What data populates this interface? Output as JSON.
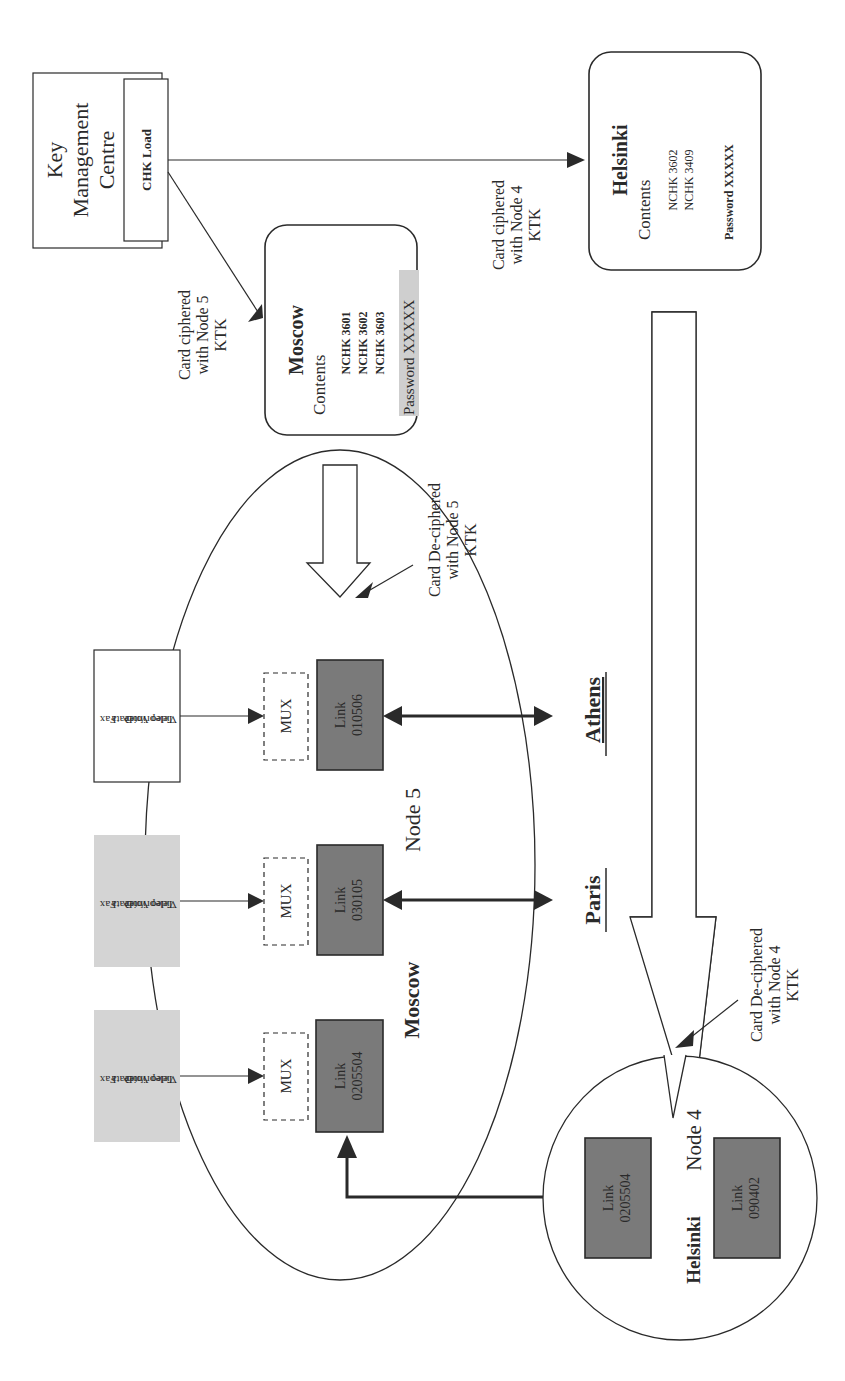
{
  "kmc": {
    "title_lines": [
      "Key",
      "Management",
      "Centre"
    ],
    "load_label": "CHK Load"
  },
  "moscow_card": {
    "title": "Moscow",
    "contents_label": "Contents",
    "keys": [
      "NCHK 3601",
      "NCHK 3602",
      "NCHK 3603"
    ],
    "password": "Password XXXXX"
  },
  "helsinki_card": {
    "title": "Helsinki",
    "contents_label": "Contents",
    "keys": [
      "NCHK 3602",
      "NCHK 3409"
    ],
    "password": "Password XXXXX"
  },
  "annotations": {
    "node5_cipher": [
      "Card ciphered",
      "with Node 5",
      "KTK"
    ],
    "node4_cipher": [
      "Card ciphered",
      "with Node 4",
      "KTK"
    ],
    "node5_decipher": [
      "Card De-ciphered",
      "with Node 5",
      "KTK"
    ],
    "node4_decipher": [
      "Card De-ciphered",
      "with Node 4",
      "KTK"
    ]
  },
  "moscow_node": {
    "city": "Moscow",
    "node": "Node 5",
    "mux_label": "MUX",
    "services": [
      "Fax",
      "Data",
      "Voice",
      "Teleprinter",
      "Video"
    ],
    "links": [
      {
        "label": "Link",
        "id": "010506",
        "destination": "Athens"
      },
      {
        "label": "Link",
        "id": "030105",
        "destination": "Paris"
      },
      {
        "label": "Link",
        "id": "0205504",
        "destination": "Helsinki"
      }
    ]
  },
  "helsinki_node": {
    "city": "Helsinki",
    "node": "Node 4",
    "links": [
      {
        "label": "Link",
        "id": "0205504"
      },
      {
        "label": "Link",
        "id": "090402"
      }
    ]
  },
  "destinations": [
    "Athens",
    "Paris"
  ],
  "colors": {
    "ink": "#2a2a2a",
    "link_fill": "#7a7a7a",
    "service_shaded": "#d4d4d4",
    "password_highlight": "#cfcfcf"
  }
}
